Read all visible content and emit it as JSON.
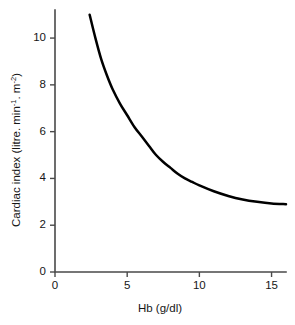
{
  "chart_data": {
    "type": "line",
    "title": "",
    "xlabel": "Hb (g/dl)",
    "ylabel": "Cardiac index (litre. min-1. m-2)",
    "ylabel_parts": {
      "prefix": "Cardiac index (litre. min",
      "sup1": "-1",
      "middle": ". m",
      "sup2": "-2",
      "suffix": ")"
    },
    "xlim": [
      0,
      16
    ],
    "ylim": [
      0,
      11.2
    ],
    "xticks": [
      0,
      5,
      10,
      15
    ],
    "xtick_labels": [
      "0",
      "5",
      "10",
      "15"
    ],
    "yticks": [
      0,
      2,
      4,
      6,
      8,
      10
    ],
    "ytick_labels": [
      "0",
      "2",
      "4",
      "6",
      "8",
      "10"
    ],
    "grid": false,
    "legend": false,
    "series": [
      {
        "name": "Cardiac index vs Hb",
        "color": "#000000",
        "x": [
          2.4,
          2.8,
          3.2,
          3.6,
          4.0,
          4.5,
          5.0,
          5.5,
          6.0,
          6.5,
          7.0,
          7.5,
          8.0,
          8.5,
          9.0,
          9.5,
          10.0,
          11.0,
          12.0,
          13.0,
          14.0,
          15.0,
          16.0
        ],
        "y": [
          11.0,
          10.0,
          9.1,
          8.4,
          7.8,
          7.2,
          6.7,
          6.2,
          5.8,
          5.4,
          5.0,
          4.7,
          4.45,
          4.2,
          4.0,
          3.85,
          3.7,
          3.45,
          3.25,
          3.1,
          3.0,
          2.93,
          2.9
        ]
      }
    ]
  },
  "axes": {
    "x_axis_name": "x-axis",
    "y_axis_name": "y-axis"
  },
  "colors": {
    "curve": "#000000",
    "axis": "#4a4a4a",
    "text": "#161616",
    "background": "#ffffff"
  }
}
